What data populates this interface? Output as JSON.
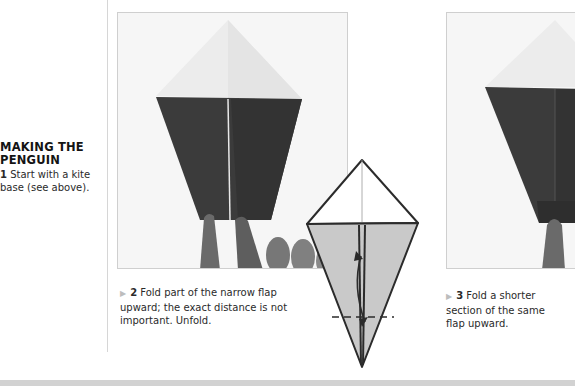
{
  "section": {
    "heading": "MAKING THE PENGUIN",
    "heading_line1": "MAKING THE",
    "heading_line2": "PENGUIN",
    "step1": {
      "number": "1",
      "text_line1": "Start with a kite",
      "text_line2": "base (see above)."
    }
  },
  "steps": [
    {
      "number": "2",
      "marker": "►",
      "text_line1": "Fold part of the narrow flap",
      "text_line2": "upward; the exact distance is not",
      "text_line3": "important. Unfold.",
      "image": "photo-kite-base-folded-dark-paper-with-fingers"
    },
    {
      "number": "3",
      "marker": "►",
      "text_line1": "Fold a shorter",
      "text_line2": "section of the same",
      "text_line3": "flap upward.",
      "image": "photo-kite-base-shorter-fold"
    }
  ],
  "diagram": {
    "name": "kite-fold-diagram",
    "icons": [
      "fold-valley-line",
      "double-arrow-up-down"
    ]
  },
  "colors": {
    "paper_dark": "#3a3a3a",
    "paper_light": "#e9e9e9",
    "diagram_fill": "#c9c9c9",
    "text": "#2a2a2a",
    "divider": "#d6d6d6"
  }
}
